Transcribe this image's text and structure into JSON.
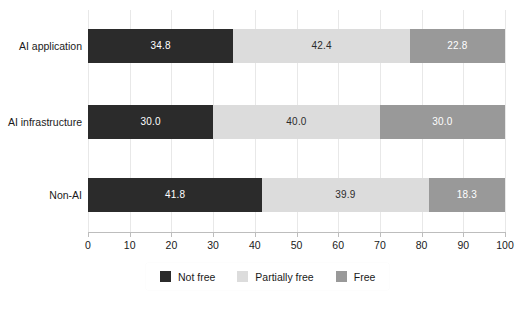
{
  "chart_data": {
    "type": "bar",
    "orientation": "horizontal",
    "stacked": true,
    "title": "",
    "xlabel": "",
    "ylabel": "",
    "xlim": [
      0,
      100
    ],
    "xticks": [
      0,
      10,
      20,
      30,
      40,
      50,
      60,
      70,
      80,
      90,
      100
    ],
    "xtick_labels": [
      "0",
      "10",
      "20",
      "30",
      "40",
      "50",
      "60",
      "70",
      "80",
      "90",
      "100"
    ],
    "grid": true,
    "legend_position": "bottom",
    "categories": [
      "AI application",
      "AI infrastructure",
      "Non-AI"
    ],
    "series": [
      {
        "name": "Not free",
        "color": "#2b2b2b",
        "values": [
          34.8,
          30.0,
          41.8
        ],
        "labels": [
          "34.8",
          "30.0",
          "41.8"
        ]
      },
      {
        "name": "Partially free",
        "color": "#dcdcdc",
        "values": [
          42.4,
          40.0,
          39.9
        ],
        "labels": [
          "42.4",
          "40.0",
          "39.9"
        ]
      },
      {
        "name": "Free",
        "color": "#999999",
        "values": [
          22.8,
          30.0,
          18.3
        ],
        "labels": [
          "22.8",
          "30.0",
          "18.3"
        ]
      }
    ]
  },
  "legend": {
    "items": [
      {
        "label": "Not free",
        "color": "#2b2b2b"
      },
      {
        "label": "Partially free",
        "color": "#dcdcdc"
      },
      {
        "label": "Free",
        "color": "#999999"
      }
    ]
  },
  "axis": {
    "x_tick_labels": [
      "0",
      "10",
      "20",
      "30",
      "40",
      "50",
      "60",
      "70",
      "80",
      "90",
      "100"
    ],
    "y_tick_labels": [
      "AI application",
      "AI infrastructure",
      "Non-AI"
    ]
  }
}
